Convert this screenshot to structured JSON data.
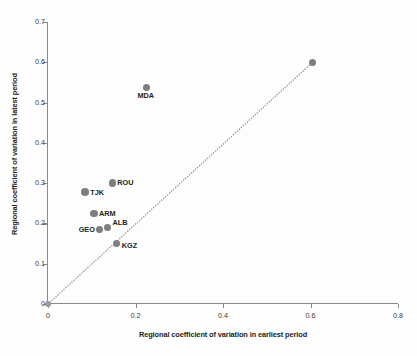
{
  "chart_data": {
    "type": "scatter",
    "title": "",
    "xlabel": "Regional coefficient of variation in earliest period",
    "ylabel": "Regional coefficient of variation in latest period",
    "xlim": [
      0,
      0.8
    ],
    "ylim": [
      0,
      0.7
    ],
    "xticks": [
      "0",
      "0.2",
      "0.4",
      "0.6",
      "0.8"
    ],
    "xtick_values": [
      0,
      0.2,
      0.4,
      0.6,
      0.8
    ],
    "yticks": [
      "0",
      "0.1",
      "0.2",
      "0.3",
      "0.4",
      "0.5",
      "0.6",
      "0.7"
    ],
    "ytick_values": [
      0,
      0.1,
      0.2,
      0.3,
      0.4,
      0.5,
      0.6,
      0.7
    ],
    "grid": false,
    "legend": null,
    "marker_color": "#7e7e7e",
    "refline": {
      "style": "dotted",
      "color": "#9a9a9a",
      "from": [
        0,
        0
      ],
      "to": [
        0.605,
        0.6
      ]
    },
    "points": [
      {
        "label": "",
        "x": 0.0,
        "y": 0.0
      },
      {
        "label": "TJK",
        "x": 0.085,
        "y": 0.278
      },
      {
        "label": "ARM",
        "x": 0.105,
        "y": 0.225
      },
      {
        "label": "GEO",
        "x": 0.118,
        "y": 0.185
      },
      {
        "label": "ALB",
        "x": 0.136,
        "y": 0.19
      },
      {
        "label": "ROU",
        "x": 0.147,
        "y": 0.3
      },
      {
        "label": "KGZ",
        "x": 0.157,
        "y": 0.15
      },
      {
        "label": "MDA",
        "x": 0.225,
        "y": 0.538
      },
      {
        "label": "",
        "x": 0.605,
        "y": 0.6
      }
    ]
  }
}
